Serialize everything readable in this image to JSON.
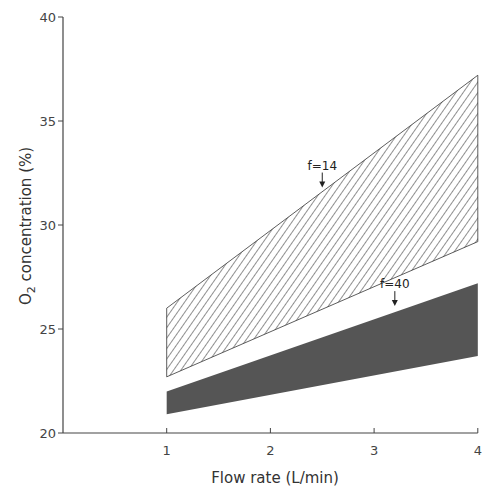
{
  "chart_data": {
    "type": "area",
    "title": "",
    "xlabel": "Flow rate (L/min)",
    "ylabel": "O2 concentration (%)",
    "ylabel_prefix": "O",
    "ylabel_sub": "2",
    "ylabel_suffix": " concentration (%)",
    "xlim": [
      0,
      4
    ],
    "ylim": [
      20,
      40
    ],
    "x_ticks": [
      1,
      2,
      3,
      4
    ],
    "y_ticks": [
      20,
      25,
      30,
      35,
      40
    ],
    "x_tick_labels": [
      "1",
      "2",
      "3",
      "4"
    ],
    "y_tick_labels": [
      "20",
      "25",
      "30",
      "35",
      "40"
    ],
    "grid": false,
    "legend": null,
    "series": [
      {
        "name": "f=14",
        "style": "hatched",
        "x": [
          1,
          4
        ],
        "upper": [
          26.0,
          37.2
        ],
        "lower": [
          22.7,
          29.2
        ]
      },
      {
        "name": "f=40",
        "style": "solid-dark",
        "x": [
          1,
          4
        ],
        "upper": [
          22.0,
          27.2
        ],
        "lower": [
          20.9,
          23.7
        ]
      }
    ],
    "annotations": [
      {
        "text": "f=14",
        "x": 2.5,
        "y": 31.8,
        "arrow": "down"
      },
      {
        "text": "f=40",
        "x": 3.2,
        "y": 26.1,
        "arrow": "down"
      }
    ]
  },
  "colors": {
    "axis": "#444444",
    "hatch": "#333333",
    "dark_band": "#555555"
  }
}
